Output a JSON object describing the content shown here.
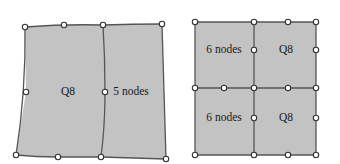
{
  "figure": {
    "name": "finite-element-mesh-comparison",
    "width": 340,
    "height": 164,
    "background": "#ffffff",
    "style": {
      "element_fill": "#c3c3c3",
      "edge_color": "#555555",
      "edge_width": 1.3,
      "node_fill": "#ffffff",
      "node_stroke": "#333333",
      "node_radius": 2.7,
      "text_color": "#1a1a1a"
    }
  },
  "left_diagram": {
    "name": "distorted-two-element-mesh",
    "labels": [
      {
        "text": "Q8",
        "x": 68,
        "y": 92
      },
      {
        "text": "5 nodes",
        "x": 131,
        "y": 92
      }
    ],
    "outline": "M 25 27 L 64 25 L 103 25 L 162 24 L 166 159 L 101 157 L 58 157 L 16 155 L 26 92 Z",
    "element_faces": [
      "M 25 27 L 64 25 L 103 25 L 105 92 L 101 157 L 58 157 L 16 155 L 26 92 Z",
      "M 103 25 L 162 24 L 166 159 L 101 157 L 105 92 Z"
    ],
    "edges": [
      "M 25 27 Q 64 24 103 25",
      "M 103 25 Q 133 24 162 24",
      "M 162 24 Q 164 92 166 159",
      "M 166 159 Q 133 158 101 157",
      "M 101 157 Q 79 157 58 157",
      "M 58 157 Q 36 157 16 155",
      "M 16 155 Q 26 92 25 27",
      "M 103 25 Q 105 58 105 92 Q 105 125 101 157"
    ],
    "nodes": [
      {
        "x": 25,
        "y": 27,
        "role": "corner"
      },
      {
        "x": 64,
        "y": 25,
        "role": "midside"
      },
      {
        "x": 103,
        "y": 25,
        "role": "corner"
      },
      {
        "x": 162,
        "y": 24,
        "role": "corner"
      },
      {
        "x": 166,
        "y": 159,
        "role": "corner"
      },
      {
        "x": 101,
        "y": 157,
        "role": "corner"
      },
      {
        "x": 58,
        "y": 157,
        "role": "midside"
      },
      {
        "x": 16,
        "y": 155,
        "role": "corner"
      },
      {
        "x": 26,
        "y": 92,
        "role": "midside"
      },
      {
        "x": 105,
        "y": 92,
        "role": "midside"
      }
    ]
  },
  "right_diagram": {
    "name": "four-element-quad-mesh",
    "labels": [
      {
        "text": "6 nodes",
        "x": 224,
        "y": 50
      },
      {
        "text": "Q8",
        "x": 286,
        "y": 50
      },
      {
        "text": "6 nodes",
        "x": 224,
        "y": 118
      },
      {
        "text": "Q8",
        "x": 286,
        "y": 118
      }
    ],
    "element_faces": [
      "M 195 22 L 254 22 L 254 88 L 195 88 Z",
      "M 254 22 L 316 22 L 316 88 L 254 88 Z",
      "M 195 88 L 254 88 L 254 155 L 195 155 Z",
      "M 254 88 L 316 88 L 316 155 L 254 155 Z"
    ],
    "edges": [
      "M 195 22 L 316 22",
      "M 195 88 L 316 88",
      "M 195 155 L 316 155",
      "M 195 22 L 195 155",
      "M 254 22 L 254 155",
      "M 316 22 L 316 155"
    ],
    "nodes": [
      {
        "x": 195,
        "y": 22,
        "role": "corner"
      },
      {
        "x": 254,
        "y": 22,
        "role": "corner"
      },
      {
        "x": 288,
        "y": 22,
        "role": "midside"
      },
      {
        "x": 316,
        "y": 22,
        "role": "corner"
      },
      {
        "x": 254,
        "y": 50,
        "role": "midside"
      },
      {
        "x": 316,
        "y": 50,
        "role": "midside"
      },
      {
        "x": 195,
        "y": 88,
        "role": "corner"
      },
      {
        "x": 224,
        "y": 88,
        "role": "midside"
      },
      {
        "x": 254,
        "y": 88,
        "role": "corner"
      },
      {
        "x": 288,
        "y": 88,
        "role": "midside"
      },
      {
        "x": 316,
        "y": 88,
        "role": "corner"
      },
      {
        "x": 254,
        "y": 118,
        "role": "midside"
      },
      {
        "x": 316,
        "y": 118,
        "role": "midside"
      },
      {
        "x": 195,
        "y": 155,
        "role": "corner"
      },
      {
        "x": 254,
        "y": 155,
        "role": "corner"
      },
      {
        "x": 288,
        "y": 155,
        "role": "midside"
      },
      {
        "x": 316,
        "y": 155,
        "role": "corner"
      }
    ]
  }
}
